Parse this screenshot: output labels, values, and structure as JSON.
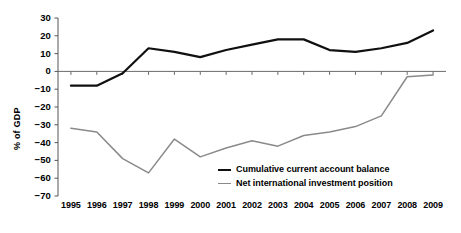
{
  "chart_data": {
    "type": "line",
    "title": "",
    "xlabel": "",
    "ylabel": "% of GDP",
    "categories": [
      "1995",
      "1996",
      "1997",
      "1998",
      "1999",
      "2000",
      "2001",
      "2002",
      "2003",
      "2004",
      "2005",
      "2006",
      "2007",
      "2008",
      "2009"
    ],
    "ylim": [
      -70,
      30
    ],
    "yticks": [
      "30",
      "20",
      "10",
      "0",
      "-10",
      "-20",
      "-30",
      "-40",
      "-50",
      "-60",
      "-70"
    ],
    "ytick_values": [
      30,
      20,
      10,
      0,
      -10,
      -20,
      -30,
      -40,
      -50,
      -60,
      -70
    ],
    "grid": false,
    "legend_position": "center-right-inside",
    "series": [
      {
        "name": "Cumulative current account balance",
        "color": "#101010",
        "width": 2.2,
        "values": [
          -8,
          -8,
          -1,
          13,
          11,
          8,
          12,
          15,
          18,
          18,
          12,
          11,
          13,
          16,
          23
        ]
      },
      {
        "name": "Net international investment position",
        "color": "#8a8a8a",
        "width": 1.5,
        "values": [
          -32,
          -34,
          -49,
          -57,
          -38,
          -48,
          -43,
          -39,
          -42,
          -36,
          -34,
          -31,
          -25,
          -3,
          -2
        ]
      }
    ]
  },
  "axis": {
    "zero_line_label": "0"
  },
  "legend": {
    "items": [
      {
        "label": "Cumulative current account balance",
        "color": "#101010",
        "width": 2.6
      },
      {
        "label": "Net international investment position",
        "color": "#8a8a8a",
        "width": 1.8
      }
    ]
  }
}
